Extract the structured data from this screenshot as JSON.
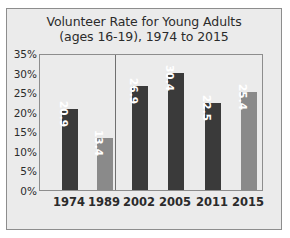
{
  "chart_data": {
    "type": "bar",
    "title": "Volunteer Rate for Young Adults (ages 16-19), 1974 to 2015",
    "title_line1": "Volunteer Rate for Young Adults",
    "title_line2": "(ages 16-19), 1974 to 2015",
    "xlabel": "",
    "ylabel": "",
    "categories": [
      "1974",
      "1989",
      "2002",
      "2005",
      "2011",
      "2015"
    ],
    "values": [
      20.9,
      13.4,
      26.9,
      30.4,
      22.5,
      25.4
    ],
    "value_labels": [
      "20.9",
      "13.4",
      "26.9",
      "30.4",
      "22.5",
      "25.4"
    ],
    "bar_colors": [
      "#3a3a3a",
      "#8a8a8a",
      "#3a3a3a",
      "#3a3a3a",
      "#3a3a3a",
      "#8a8a8a"
    ],
    "ylim": [
      0,
      35
    ],
    "yticks": [
      0,
      5,
      10,
      15,
      20,
      25,
      30,
      35
    ],
    "ytick_labels": [
      "0%",
      "5%",
      "10%",
      "15%",
      "20%",
      "25%",
      "30%",
      "35%"
    ],
    "grid": false,
    "legend": "none",
    "group_divider_after_category": "1989",
    "frame_color": "#8d8d8d",
    "background_color": "#ebebeb",
    "text_color": "#2b2b2b",
    "value_label_color": "#ffffff"
  }
}
